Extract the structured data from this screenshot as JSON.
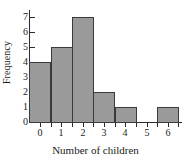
{
  "chart_data": {
    "type": "bar",
    "title": "",
    "xlabel": "Number of children",
    "ylabel": "Frequency",
    "categories": [
      "0",
      "1",
      "2",
      "3",
      "4",
      "5",
      "6"
    ],
    "values": [
      4,
      5,
      7,
      2,
      1,
      0,
      1
    ],
    "xlim": [
      -0.5,
      6.7
    ],
    "ylim": [
      0,
      7
    ],
    "yticks": [
      "0",
      "1",
      "2",
      "3",
      "4",
      "5",
      "6",
      "7"
    ],
    "xticks": [
      "0",
      "1",
      "2",
      "3",
      "4",
      "5",
      "6"
    ],
    "grid": false,
    "legend": false,
    "colors": {
      "bar_fill": "#9a9a9a",
      "bar_edge": "#3a3a3a",
      "axis": "#2b2b2b",
      "text": "#1a1a1a",
      "background": "#ffffff"
    }
  }
}
